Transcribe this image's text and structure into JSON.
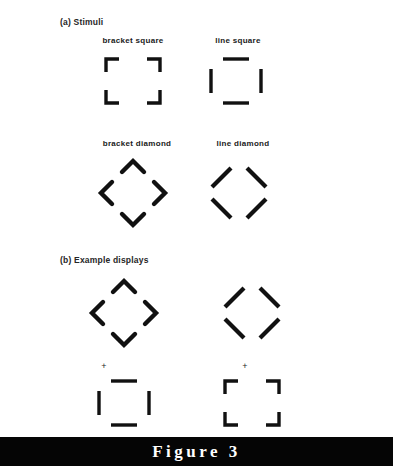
{
  "figure": {
    "caption": "F i g u r e   3",
    "caption_plain": "Figure 3",
    "background_color": "#ffffff",
    "ink_color": "#111111",
    "caption_bar_color": "#050505",
    "caption_text_color": "#ffffff"
  },
  "panels": [
    {
      "id": "a",
      "label": "(a) Stimuli",
      "stimuli": [
        {
          "name": "bracket-square",
          "caption": "bracket  square",
          "caption_plain": "bracket square",
          "type": "square",
          "element": "bracket",
          "center": {
            "x": 133,
            "y": 81
          },
          "size": 54,
          "stroke": 3.4
        },
        {
          "name": "line-square",
          "caption": "line  square",
          "caption_plain": "line square",
          "type": "square",
          "element": "line",
          "center": {
            "x": 236,
            "y": 81
          },
          "size": 52,
          "stroke": 3.4
        },
        {
          "name": "bracket-diamond",
          "caption": "bracket  diamond",
          "caption_plain": "bracket diamond",
          "type": "diamond",
          "element": "bracket",
          "center": {
            "x": 133,
            "y": 193
          },
          "size": 62,
          "stroke": 4.2
        },
        {
          "name": "line-diamond",
          "caption": "line  diamond",
          "caption_plain": "line diamond",
          "type": "diamond",
          "element": "line",
          "center": {
            "x": 239,
            "y": 193
          },
          "size": 58,
          "stroke": 4.2
        }
      ]
    },
    {
      "id": "b",
      "label": "(b) Example displays",
      "displays": [
        {
          "name": "example-display-left",
          "column": "left",
          "target": {
            "name": "bracket-diamond",
            "type": "diamond",
            "element": "bracket",
            "center": {
              "x": 124,
              "y": 313
            },
            "size": 62,
            "stroke": 4.2
          },
          "fixation": {
            "symbol": "+",
            "x": 104,
            "y": 366
          },
          "probe": {
            "name": "line-square",
            "type": "square",
            "element": "line",
            "center": {
              "x": 124,
              "y": 403
            },
            "size": 52,
            "stroke": 3.4
          }
        },
        {
          "name": "example-display-right",
          "column": "right",
          "target": {
            "name": "line-diamond",
            "type": "diamond",
            "element": "line",
            "center": {
              "x": 252,
              "y": 313
            },
            "size": 58,
            "stroke": 4.2
          },
          "fixation": {
            "symbol": "+",
            "x": 245,
            "y": 366
          },
          "probe": {
            "name": "bracket-square",
            "type": "square",
            "element": "bracket",
            "center": {
              "x": 252,
              "y": 403
            },
            "size": 54,
            "stroke": 3.4
          }
        }
      ]
    }
  ]
}
